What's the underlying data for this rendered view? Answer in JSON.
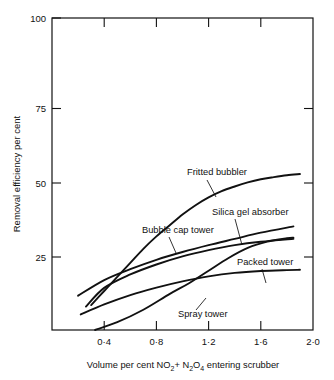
{
  "chart_data": {
    "type": "line",
    "title": "",
    "xlabel": "Volume per cent NO2+ N2O4 entering scrubber",
    "ylabel": "Removal efficiency per cent",
    "xlim": [
      0.0,
      2.0
    ],
    "ylim": [
      0,
      100
    ],
    "grid": false,
    "legend_position": "inline-annotations",
    "x_tick_labels": [
      "0·4",
      "0·8",
      "1·2",
      "1·6",
      "2·0"
    ],
    "x_tick_values": [
      0.4,
      0.8,
      1.2,
      1.6,
      2.0
    ],
    "y_tick_labels": [
      "25",
      "50",
      "75",
      "100"
    ],
    "y_tick_values": [
      25,
      50,
      75,
      100
    ],
    "series": [
      {
        "name": "Fritted bubbler",
        "x": [
          0.3,
          0.4,
          0.5,
          0.6,
          0.7,
          0.8,
          0.9,
          1.0,
          1.1,
          1.2,
          1.3,
          1.4,
          1.5,
          1.6,
          1.7,
          1.8,
          1.9
        ],
        "values": [
          8.0,
          12.5,
          17.0,
          21.5,
          26.0,
          30.0,
          33.5,
          37.0,
          40.0,
          42.5,
          44.5,
          46.0,
          47.3,
          48.3,
          49.0,
          49.6,
          50.0
        ]
      },
      {
        "name": "Silica gel absorber",
        "x": [
          0.2,
          0.4,
          0.6,
          0.8,
          1.0,
          1.2,
          1.4,
          1.6,
          1.85
        ],
        "values": [
          11.0,
          16.0,
          19.5,
          22.5,
          25.0,
          27.2,
          29.2,
          31.2,
          33.2
        ]
      },
      {
        "name": "Bubble cap tower",
        "x": [
          0.26,
          0.4,
          0.6,
          0.8,
          1.0,
          1.2,
          1.4,
          1.6,
          1.85
        ],
        "values": [
          7.5,
          13.5,
          17.8,
          21.0,
          23.6,
          25.6,
          27.2,
          28.3,
          29.2
        ]
      },
      {
        "name": "Packed tower",
        "x": [
          0.22,
          0.4,
          0.6,
          0.8,
          1.0,
          1.2,
          1.4,
          1.6,
          1.8,
          1.9
        ],
        "values": [
          5.0,
          8.2,
          11.2,
          13.6,
          15.6,
          17.2,
          18.3,
          18.9,
          19.2,
          19.3
        ]
      },
      {
        "name": "Spray tower",
        "x": [
          0.33,
          0.5,
          0.7,
          0.9,
          1.05,
          1.2,
          1.35,
          1.5,
          1.65,
          1.8,
          1.85
        ],
        "values": [
          0.0,
          2.5,
          6.5,
          11.5,
          15.0,
          19.0,
          23.0,
          26.3,
          28.3,
          29.4,
          29.6
        ]
      }
    ],
    "annotations": [
      {
        "label": "Fritted bubbler",
        "text_x": 187,
        "text_y": 175,
        "leader": "M 207 180 L 216 197"
      },
      {
        "label": "Silica gel absorber",
        "text_x": 212,
        "text_y": 215,
        "leader": "M 235 219 L 242 245"
      },
      {
        "label": "Bubble cap tower",
        "text_x": 142,
        "text_y": 233,
        "leader": "M 169 237 L 176 253"
      },
      {
        "label": "Packed tower",
        "text_x": 237,
        "text_y": 265,
        "leader": "M 262 269 L 266 283"
      },
      {
        "label": "Spray tower",
        "text_x": 178,
        "text_y": 317,
        "leader": "M 196 310 L 206 298"
      }
    ]
  },
  "axis_title_parts": {
    "x_pre": "Volume per cent NO",
    "x_sub1": "2",
    "x_mid": "+ N",
    "x_sub2": "2",
    "x_mid2": "O",
    "x_sub3": "4",
    "x_post": " entering scrubber"
  }
}
